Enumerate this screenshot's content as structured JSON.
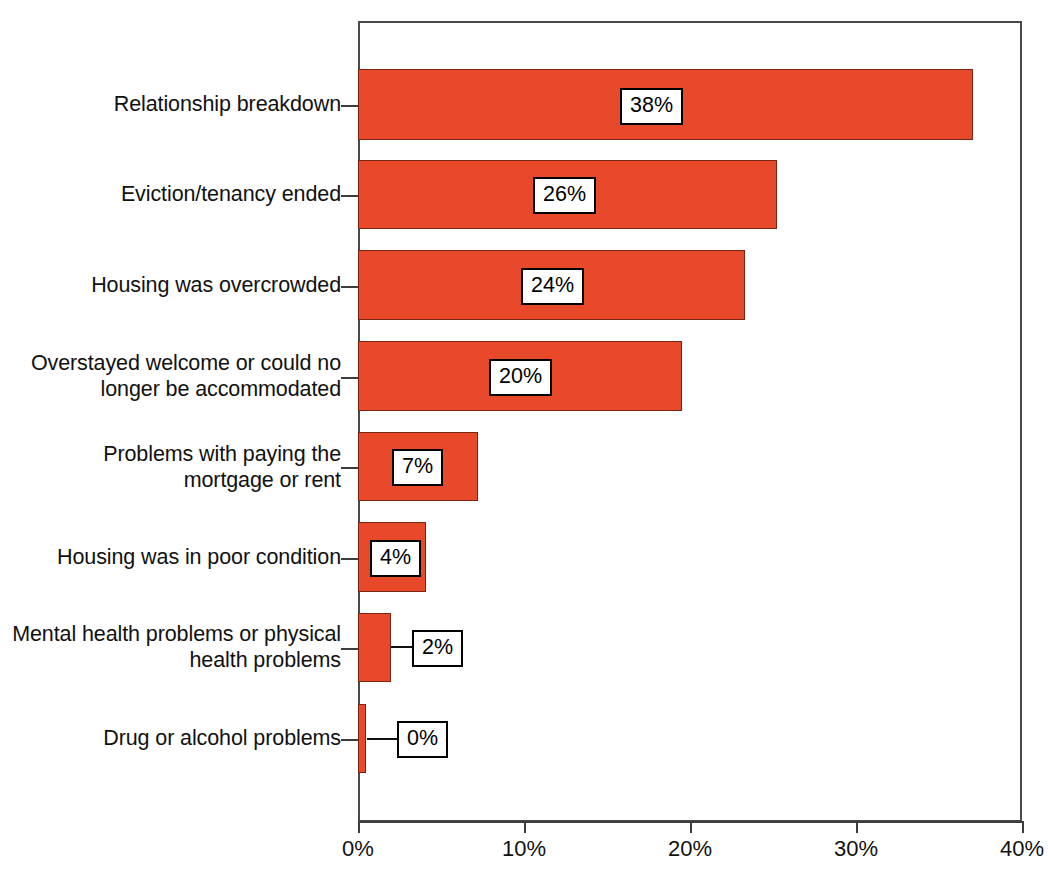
{
  "chart_data": {
    "type": "bar",
    "orientation": "horizontal",
    "title": "",
    "subtitle": "",
    "xlabel": "",
    "ylabel": "",
    "xlim": [
      0,
      42.5
    ],
    "grid": false,
    "legend": null,
    "bar_color": "#E8492B",
    "bar_edge_color": "#7A2414",
    "frame_color": "#4A4A4A",
    "categories": [
      "Relationship breakdown",
      "Eviction/tenancy ended",
      "Housing was overcrowded",
      "Overstayed welcome or could no\nlonger be accommodated",
      "Problems with paying the\nmortgage or rent",
      "Housing was in poor condition",
      "Mental health problems or physical\nhealth problems",
      "Drug or alcohol problems"
    ],
    "values": [
      38,
      26,
      24,
      20,
      7,
      4,
      2,
      0
    ],
    "data_labels": [
      "38%",
      "26%",
      "24%",
      "20%",
      "7%",
      "4%",
      "2%",
      "0%"
    ],
    "xticks": [
      0,
      10,
      20,
      30,
      40
    ],
    "xtick_labels": [
      "0%",
      "10%",
      "20%",
      "30%",
      "40%"
    ]
  },
  "bars": [
    {
      "label": "Relationship breakdown",
      "value_text": "38%",
      "px": {
        "top": 69,
        "height": 71,
        "width": 615,
        "box_left": 620,
        "box_top": 88,
        "leader": null
      }
    },
    {
      "label": "Eviction/tenancy ended",
      "value_text": "26%",
      "px": {
        "top": 160,
        "height": 69,
        "width": 419,
        "box_left": 533,
        "box_top": 177,
        "leader": null
      }
    },
    {
      "label": "Housing was overcrowded",
      "value_text": "24%",
      "px": {
        "top": 250,
        "height": 70,
        "width": 387,
        "box_left": 521,
        "box_top": 268,
        "leader": null
      }
    },
    {
      "label": "Overstayed welcome or could no longer be accommodated",
      "value_text": "20%",
      "px": {
        "top": 341,
        "height": 70,
        "width": 324,
        "box_left": 489,
        "box_top": 359,
        "leader": null
      }
    },
    {
      "label": "Problems with paying the mortgage or rent",
      "value_text": "7%",
      "px": {
        "top": 432,
        "height": 69,
        "width": 120,
        "box_left": 392,
        "box_top": 449,
        "leader": null
      }
    },
    {
      "label": "Housing was in poor condition",
      "value_text": "4%",
      "px": {
        "top": 522,
        "height": 70,
        "width": 68,
        "box_left": 370,
        "box_top": 540,
        "leader": null
      }
    },
    {
      "label": "Mental health problems or physical health problems",
      "value_text": "2%",
      "px": {
        "top": 613,
        "height": 69,
        "width": 33,
        "box_left": 412,
        "box_top": 630,
        "leader": {
          "left": 391,
          "top": 646,
          "width": 22
        }
      }
    },
    {
      "label": "Drug or alcohol problems",
      "value_text": "0%",
      "px": {
        "top": 704,
        "height": 69,
        "width": 8,
        "box_left": 397,
        "box_top": 721,
        "leader": {
          "left": 367,
          "top": 738,
          "width": 31
        }
      }
    }
  ],
  "y_ticks_px": [
    105,
    195,
    286,
    377,
    467,
    558,
    648,
    739
  ],
  "category_labels_px": [
    {
      "text": "Relationship breakdown",
      "top": 91
    },
    {
      "text": "Eviction/tenancy ended",
      "top": 181
    },
    {
      "text": "Housing was overcrowded",
      "top": 272
    },
    {
      "text": "Overstayed welcome or could no\nlonger be accommodated",
      "top": 350
    },
    {
      "text": "Problems with paying the\nmortgage or rent",
      "top": 441
    },
    {
      "text": "Housing was in poor condition",
      "top": 544
    },
    {
      "text": "Mental health problems or physical\nhealth problems",
      "top": 621
    },
    {
      "text": "Drug or alcohol problems",
      "top": 725
    }
  ],
  "x_ticks_px": [
    {
      "label": "0%",
      "x": 358
    },
    {
      "label": "10%",
      "x": 524
    },
    {
      "label": "20%",
      "x": 690
    },
    {
      "label": "30%",
      "x": 856
    },
    {
      "label": "40%",
      "x": 1022
    }
  ]
}
